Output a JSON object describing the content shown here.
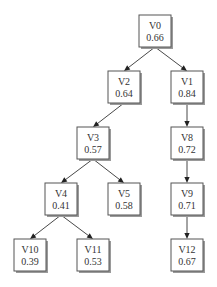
{
  "diagram": {
    "type": "tree",
    "nodes": [
      {
        "id": "V0",
        "name": "V0",
        "value": "0.66"
      },
      {
        "id": "V2",
        "name": "V2",
        "value": "0.64"
      },
      {
        "id": "V1",
        "name": "V1",
        "value": "0.84"
      },
      {
        "id": "V3",
        "name": "V3",
        "value": "0.57"
      },
      {
        "id": "V8",
        "name": "V8",
        "value": "0.72"
      },
      {
        "id": "V4",
        "name": "V4",
        "value": "0.41"
      },
      {
        "id": "V5",
        "name": "V5",
        "value": "0.58"
      },
      {
        "id": "V9",
        "name": "V9",
        "value": "0.71"
      },
      {
        "id": "V10",
        "name": "V10",
        "value": "0.39"
      },
      {
        "id": "V11",
        "name": "V11",
        "value": "0.53"
      },
      {
        "id": "V12",
        "name": "V12",
        "value": "0.67"
      }
    ],
    "edges": [
      {
        "from": "V0",
        "to": "V2"
      },
      {
        "from": "V0",
        "to": "V1"
      },
      {
        "from": "V2",
        "to": "V3"
      },
      {
        "from": "V1",
        "to": "V8"
      },
      {
        "from": "V3",
        "to": "V4"
      },
      {
        "from": "V3",
        "to": "V5"
      },
      {
        "from": "V8",
        "to": "V9"
      },
      {
        "from": "V4",
        "to": "V10"
      },
      {
        "from": "V4",
        "to": "V11"
      },
      {
        "from": "V9",
        "to": "V12"
      }
    ]
  }
}
